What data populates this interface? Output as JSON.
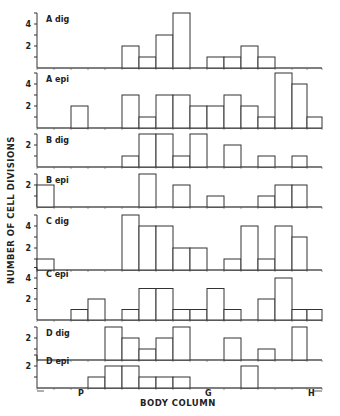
{
  "chart_data": {
    "type": "bar",
    "subtype": "multi-panel histogram",
    "title": "",
    "xlabel": "BODY COLUMN",
    "ylabel": "NUMBER OF CELL DIVISIONS",
    "x_markers": [
      "P",
      "G",
      "H"
    ],
    "bins": 17,
    "panels": [
      {
        "name": "A dig",
        "yticks": [
          2,
          4
        ],
        "values": [
          0,
          0,
          0,
          0,
          0,
          2,
          1,
          3,
          5,
          0,
          1,
          1,
          2,
          1,
          0,
          0,
          0
        ]
      },
      {
        "name": "A epi",
        "yticks": [
          2,
          4
        ],
        "values": [
          0,
          0,
          2,
          0,
          0,
          3,
          1,
          3,
          3,
          2,
          2,
          3,
          2,
          1,
          5,
          4,
          1
        ]
      },
      {
        "name": "B dig",
        "yticks": [
          2
        ],
        "values": [
          0,
          0,
          0,
          0,
          0,
          1,
          3,
          3,
          1,
          3,
          0,
          2,
          0,
          1,
          0,
          1,
          0
        ]
      },
      {
        "name": "B epi",
        "yticks": [
          2
        ],
        "values": [
          2,
          0,
          0,
          0,
          0,
          0,
          3,
          0,
          2,
          0,
          1,
          0,
          0,
          1,
          2,
          2,
          0
        ]
      },
      {
        "name": "C dig",
        "yticks": [
          2,
          4
        ],
        "values": [
          1,
          0,
          0,
          0,
          0,
          5,
          4,
          4,
          2,
          2,
          0,
          1,
          4,
          1,
          4,
          3,
          0
        ]
      },
      {
        "name": "C epi",
        "yticks": [
          2,
          4
        ],
        "values": [
          0,
          0,
          1,
          2,
          0,
          1,
          3,
          3,
          1,
          1,
          3,
          1,
          0,
          2,
          4,
          1,
          1
        ]
      },
      {
        "name": "D dig",
        "yticks": [
          2
        ],
        "values": [
          0,
          0,
          0,
          0,
          3,
          2,
          1,
          2,
          3,
          0,
          0,
          2,
          0,
          1,
          0,
          3,
          0
        ]
      },
      {
        "name": "D epi",
        "yticks": [
          2
        ],
        "values": [
          0,
          0,
          0,
          1,
          2,
          2,
          1,
          1,
          1,
          0,
          0,
          0,
          2,
          0,
          0,
          0,
          0
        ]
      }
    ]
  },
  "labels": {
    "ylabel": "NUMBER OF CELL DIVISIONS",
    "xlabel": "BODY COLUMN"
  }
}
